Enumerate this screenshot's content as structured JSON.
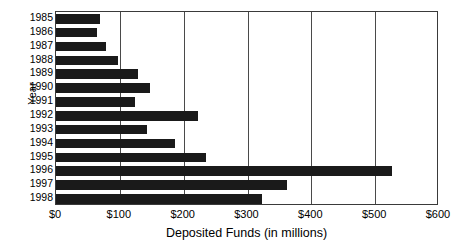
{
  "chart_data": {
    "type": "bar",
    "orientation": "horizontal",
    "title": "",
    "xlabel": "Deposited Funds (in millions)",
    "ylabel": "Year",
    "categories": [
      "1985",
      "1986",
      "1987",
      "1988",
      "1989",
      "1990",
      "1991",
      "1992",
      "1993",
      "1994",
      "1995",
      "1996",
      "1997",
      "1998"
    ],
    "values": [
      69,
      64,
      78,
      97,
      128,
      147,
      124,
      222,
      143,
      186,
      235,
      527,
      362,
      322
    ],
    "series": [
      {
        "name": "Deposited Funds",
        "values": [
          69,
          64,
          78,
          97,
          128,
          147,
          124,
          222,
          143,
          186,
          235,
          527,
          362,
          322
        ]
      }
    ],
    "xlim": [
      0,
      600
    ],
    "xticks": [
      0,
      100,
      200,
      300,
      400,
      500,
      600
    ],
    "xtick_labels": [
      "$0",
      "$100",
      "$200",
      "$300",
      "$400",
      "$500",
      "$600"
    ],
    "grid": "vertical",
    "legend": "none",
    "bar_color": "#1a1a1a",
    "axis_color": "#3a3a3a",
    "background": "#ffffff"
  }
}
